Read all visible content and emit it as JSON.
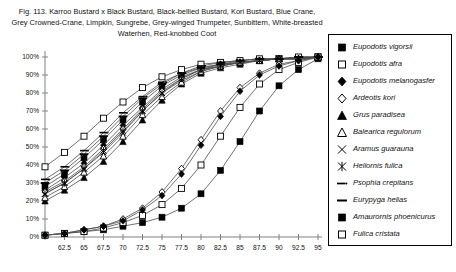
{
  "figure": {
    "title_lines": [
      "Fig. 113.  Karroo Bustard x Black Bustard, Black-bellied Bustard, Kori Bustard, Blue Crane,",
      "Grey Crowned-Crane, Limpkin, Sungrebe, Grey-winged Trumpeter, Sunbittern, White-breasted",
      "Waterhen, Red-knobbed Coot"
    ]
  },
  "chart_data": {
    "type": "line",
    "xlabel": "",
    "ylabel": "",
    "xlim": [
      60,
      95
    ],
    "ylim": [
      0,
      100
    ],
    "grid": false,
    "legend_position": "right",
    "x_tick_labels": [
      "",
      "62.5",
      "65",
      "67.5",
      "70",
      "72.5",
      "75",
      "77.5",
      "80",
      "82.5",
      "85",
      "87.5",
      "90",
      "92.5",
      "95"
    ],
    "x_ticks": [
      60,
      62.5,
      65,
      67.5,
      70,
      72.5,
      75,
      77.5,
      80,
      82.5,
      85,
      87.5,
      90,
      92.5,
      95
    ],
    "y_tick_labels": [
      "0%",
      "10%",
      "20%",
      "30%",
      "40%",
      "50%",
      "60%",
      "70%",
      "80%",
      "90%",
      "100%"
    ],
    "y_ticks": [
      0,
      10,
      20,
      30,
      40,
      50,
      60,
      70,
      80,
      90,
      100
    ],
    "x": [
      60,
      62.5,
      65,
      67.5,
      70,
      72.5,
      75,
      77.5,
      80,
      82.5,
      85,
      87.5,
      90,
      92.5,
      95
    ],
    "series": [
      {
        "name": "Eupodotis vigorsii",
        "marker": "filled-square",
        "values": [
          28,
          35,
          44,
          54,
          65,
          75,
          84,
          90,
          94,
          96,
          97,
          98,
          99,
          99,
          100
        ]
      },
      {
        "name": "Eupodotis afra",
        "marker": "open-square",
        "values": [
          39,
          47,
          56,
          66,
          75,
          83,
          89,
          93,
          96,
          97,
          98,
          99,
          99,
          100,
          100
        ]
      },
      {
        "name": "Eupodotis melanogasfer",
        "marker": "filled-diamond",
        "values": [
          26,
          33,
          41,
          51,
          62,
          72,
          82,
          89,
          93,
          96,
          97,
          98,
          99,
          99,
          100
        ]
      },
      {
        "name": "Ardeotis kori",
        "marker": "open-diamond",
        "values": [
          25,
          31,
          39,
          49,
          60,
          71,
          81,
          88,
          93,
          95,
          97,
          98,
          99,
          99,
          100
        ]
      },
      {
        "name": "Grus paradisea",
        "marker": "filled-triangle",
        "values": [
          20,
          26,
          33,
          42,
          53,
          65,
          76,
          85,
          91,
          94,
          96,
          98,
          99,
          99,
          100
        ]
      },
      {
        "name": "Balearica regulorum",
        "marker": "open-triangle",
        "values": [
          22,
          28,
          36,
          45,
          56,
          68,
          78,
          86,
          92,
          95,
          97,
          98,
          99,
          99,
          100
        ]
      },
      {
        "name": "Aramus guarauna",
        "marker": "x-cross",
        "values": [
          24,
          30,
          38,
          47,
          58,
          70,
          80,
          87,
          92,
          95,
          97,
          98,
          99,
          99,
          100
        ]
      },
      {
        "name": "Heliornis fulica",
        "marker": "asterisk",
        "values": [
          24,
          30,
          38,
          48,
          59,
          70,
          80,
          88,
          93,
          95,
          97,
          98,
          99,
          99,
          100
        ]
      },
      {
        "name": "Psophia crepitans",
        "marker": "dash-dot",
        "values": [
          32,
          39,
          48,
          58,
          69,
          78,
          86,
          91,
          95,
          97,
          98,
          99,
          99,
          100,
          100
        ]
      },
      {
        "name": "Eurypyga helias",
        "marker": "dash",
        "values": [
          30,
          37,
          46,
          56,
          67,
          77,
          85,
          91,
          94,
          96,
          98,
          99,
          99,
          100,
          100
        ]
      },
      {
        "name": "Amaurornis phoenicurus",
        "marker": "filled-square",
        "values": [
          1,
          2,
          3,
          4,
          6,
          8,
          11,
          16,
          24,
          37,
          53,
          70,
          84,
          93,
          99
        ]
      },
      {
        "name": "Fulica cristata",
        "marker": "open-square",
        "values": [
          1,
          2,
          3,
          5,
          8,
          12,
          18,
          27,
          40,
          56,
          72,
          85,
          93,
          97,
          100
        ]
      }
    ],
    "series_lower_extra": [
      {
        "name": "lower-open-diamond",
        "marker": "open-diamond",
        "values": [
          1,
          2,
          4,
          6,
          10,
          16,
          25,
          38,
          54,
          70,
          83,
          91,
          96,
          98,
          100
        ]
      },
      {
        "name": "lower-filled-diamond",
        "marker": "filled-diamond",
        "values": [
          1,
          2,
          4,
          6,
          9,
          15,
          23,
          35,
          51,
          67,
          81,
          90,
          95,
          98,
          100
        ]
      }
    ]
  },
  "legend": {
    "items": [
      {
        "label": "Eupodotis vigorsii",
        "marker": "filled-square"
      },
      {
        "label": "Eupodotis afra",
        "marker": "open-square"
      },
      {
        "label": "Eupodotis melanogasfer",
        "marker": "filled-diamond"
      },
      {
        "label": "Ardeotis kori",
        "marker": "open-diamond"
      },
      {
        "label": "Grus paradisea",
        "marker": "filled-triangle"
      },
      {
        "label": "Balearica regulorum",
        "marker": "open-triangle"
      },
      {
        "label": "Aramus guarauna",
        "marker": "x-cross"
      },
      {
        "label": "Heliornis fulica",
        "marker": "asterisk"
      },
      {
        "label": "Psophia crepitans",
        "marker": "dash-dot"
      },
      {
        "label": "Eurypyga helias",
        "marker": "dash"
      },
      {
        "label": "Amaurornis phoenicurus",
        "marker": "filled-square"
      },
      {
        "label": "Fulica cristata",
        "marker": "open-square"
      }
    ]
  },
  "colors": {
    "line": "#4d4d4d",
    "marker": "#000000",
    "axis": "#808080",
    "text": "#111111"
  }
}
